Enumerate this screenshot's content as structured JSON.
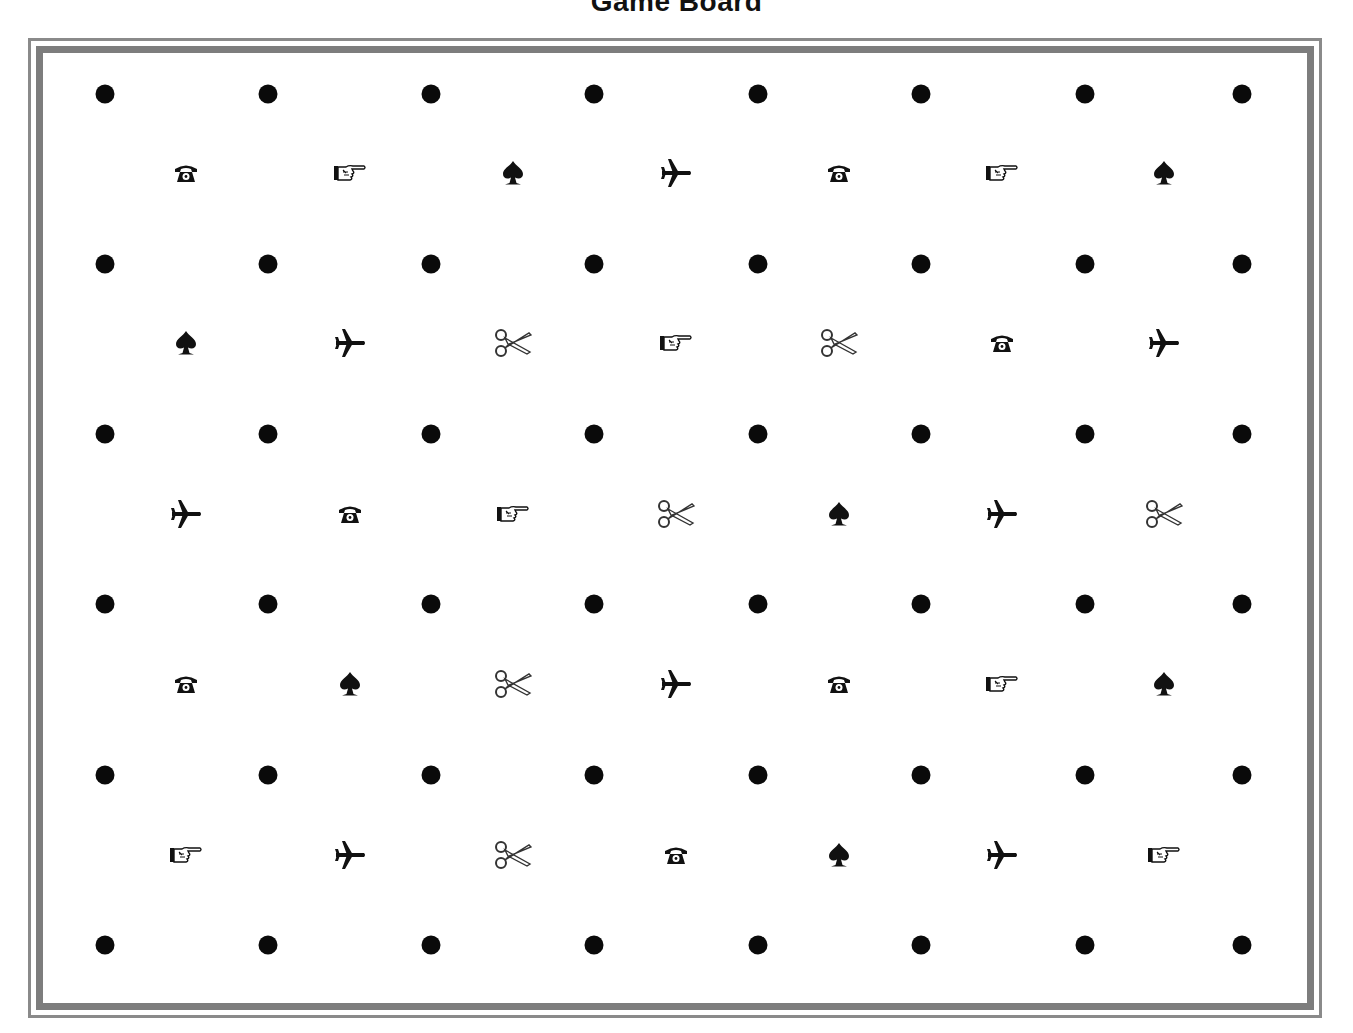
{
  "title": "Game Board",
  "colors": {
    "frame": "#808080",
    "dot": "#0a0a0a",
    "icon": "#111111",
    "background": "#ffffff"
  },
  "board": {
    "dot_columns_x": [
      105,
      268,
      431,
      594,
      758,
      921,
      1085,
      1242
    ],
    "dot_rows_y": [
      94,
      264,
      434,
      604,
      775,
      945
    ],
    "icon_columns_x": [
      186,
      350,
      513,
      676,
      839,
      1002,
      1164
    ],
    "icon_rows_y": [
      173,
      343,
      514,
      684,
      855
    ],
    "icon_rows": [
      [
        "telephone",
        "pointing-hand",
        "spade",
        "airplane",
        "telephone",
        "pointing-hand",
        "spade"
      ],
      [
        "spade",
        "airplane",
        "scissors",
        "pointing-hand",
        "scissors",
        "telephone",
        "airplane"
      ],
      [
        "airplane",
        "telephone",
        "pointing-hand",
        "scissors",
        "spade",
        "airplane",
        "scissors"
      ],
      [
        "telephone",
        "spade",
        "scissors",
        "airplane",
        "telephone",
        "pointing-hand",
        "spade"
      ],
      [
        "pointing-hand",
        "airplane",
        "scissors",
        "telephone",
        "spade",
        "airplane",
        "pointing-hand"
      ]
    ]
  }
}
